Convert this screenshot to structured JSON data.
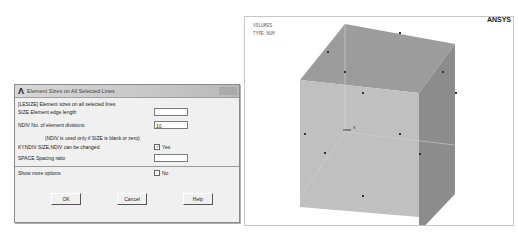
{
  "dialog": {
    "title": "Element Sizes on All Selected Lines",
    "header": "[LESIZE]  Element sizes on all selected lines",
    "size_label": "SIZE    Element edge length",
    "size_value": "",
    "ndiv_label": "NDIV    No. of element divisions",
    "ndiv_value": "10",
    "ndiv_note": "(NDIV is used only if SIZE is blank or zero)",
    "kyndiv_label": "KYNDIV  SIZE,NDIV can be changed",
    "kyndiv_checked": true,
    "kyndiv_value": "Yes",
    "space_label": "SPACE   Spacing ratio",
    "space_value": "",
    "more_options_label": "Show more options",
    "more_options_value": "No",
    "buttons": {
      "ok": "OK",
      "cancel": "Cancel",
      "help": "Help"
    }
  },
  "graphics": {
    "legend_line1": "VOLUMES",
    "legend_line2": "TYPE NUM",
    "brand": "ANSYS",
    "axis_label": "X",
    "colors": {
      "front": "#bdbdbd",
      "top": "#9a9a9a",
      "side": "#8a8a8a"
    }
  }
}
